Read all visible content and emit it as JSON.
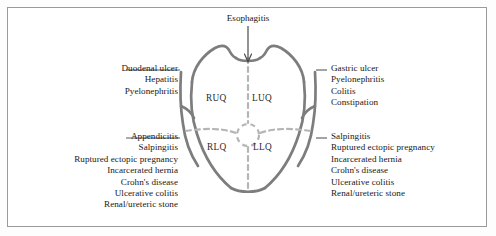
{
  "diagram": {
    "title_label": "Esophagitis",
    "quadrants": {
      "ruq": "RUQ",
      "luq": "LUQ",
      "rlq": "RLQ",
      "llq": "LLQ"
    },
    "upper_left_conditions": [
      "Duodenal ulcer",
      "Hepatitis",
      "Pyelonephritis"
    ],
    "lower_left_conditions": [
      "Appendicitis",
      "Salpingitis",
      "Ruptured ectopic pregnancy",
      "Incarcerated hernia",
      "Crohn's disease",
      "Ulcerative colitis",
      "Renal/ureteric stone"
    ],
    "upper_right_conditions": [
      "Gastric ulcer",
      "Pyelonephritis",
      "Colitis",
      "Constipation"
    ],
    "lower_right_conditions": [
      "Salpingitis",
      "Ruptured ectopic pregnancy",
      "Incarcerated hernia",
      "Crohn's disease",
      "Ulcerative colitis",
      "Renal/ureteric stone"
    ],
    "colors": {
      "body_outline": "#7d7d7d",
      "quadrant_divider": "#b5b5b5",
      "leader_line": "#5a5a5a",
      "frame_border": "#9a9a9a",
      "text": "#171717",
      "background": "#ffffff"
    }
  }
}
